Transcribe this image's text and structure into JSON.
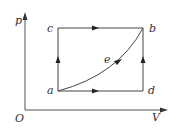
{
  "diagram": {
    "type": "p-V diagram",
    "axes": {
      "y_label": "p",
      "x_label": "V",
      "origin_label": "O"
    },
    "points": {
      "a": "a",
      "b": "b",
      "c": "c",
      "d": "d",
      "e": "e"
    },
    "paths": [
      {
        "name": "a-c",
        "direction": "up"
      },
      {
        "name": "c-b",
        "direction": "right"
      },
      {
        "name": "a-d",
        "direction": "right"
      },
      {
        "name": "d-b",
        "direction": "up"
      },
      {
        "name": "a-e-b",
        "direction": "curve toward b"
      }
    ],
    "colors": {
      "line": "#444444",
      "text": "#333333"
    }
  }
}
